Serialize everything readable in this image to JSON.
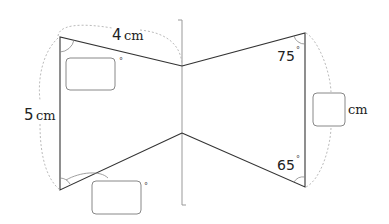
{
  "diagram": {
    "labels": {
      "top_edge_length": "4",
      "top_edge_unit": "cm",
      "left_edge_length": "5",
      "left_edge_unit": "cm",
      "right_edge_unit": "cm",
      "angle_top_right": "75",
      "angle_bottom_right": "65",
      "degree_symbol": "°"
    },
    "answer_boxes": [
      {
        "id": "angle-top-left",
        "unit": "°",
        "value": ""
      },
      {
        "id": "angle-bottom-left",
        "unit": "°",
        "value": ""
      },
      {
        "id": "right-edge-length",
        "unit": "cm",
        "value": ""
      }
    ],
    "colors": {
      "edge": "#333333",
      "axis": "#999999",
      "dimension_arc": "#bbbbbb",
      "box_border": "#888888"
    }
  }
}
